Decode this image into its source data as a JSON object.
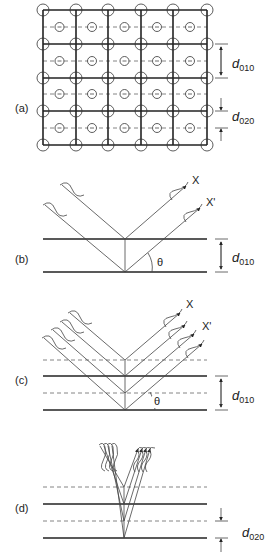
{
  "figure": {
    "panels": [
      {
        "id": "a",
        "label": "(a)",
        "description": "Square lattice with atoms at corners and body-centered atoms on dashed mid-planes",
        "spacings": [
          {
            "symbol": "d",
            "subscript": "010"
          },
          {
            "symbol": "d",
            "subscript": "020"
          }
        ]
      },
      {
        "id": "b",
        "label": "(b)",
        "description": "X-ray reflection from two (010) planes",
        "rays": [
          "X",
          "X'"
        ],
        "angle": "θ",
        "spacing": {
          "symbol": "d",
          "subscript": "010"
        }
      },
      {
        "id": "c",
        "label": "(c)",
        "description": "Reflection from (010) planes with intermediate dashed (020) planes",
        "rays": [
          "X",
          "X'"
        ],
        "angle": "θ",
        "spacing": {
          "symbol": "d",
          "subscript": "010"
        }
      },
      {
        "id": "d",
        "label": "(d)",
        "description": "Steep reflection from (020) planes",
        "spacing": {
          "symbol": "d",
          "subscript": "020"
        }
      }
    ]
  }
}
